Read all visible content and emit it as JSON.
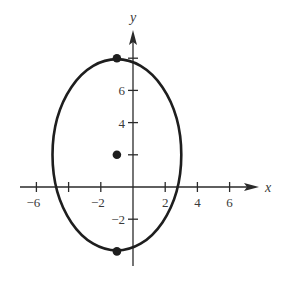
{
  "chart_data": {
    "type": "line",
    "title": "",
    "xlabel": "x",
    "ylabel": "y",
    "xlim": [
      -7,
      7.8
    ],
    "ylim": [
      -5,
      9.8
    ],
    "grid": false,
    "x_ticks": [
      -6,
      -4,
      -2,
      2,
      4,
      6
    ],
    "x_tick_labels": [
      "-6",
      "",
      "-2",
      "2",
      "4",
      "6"
    ],
    "y_ticks": [
      -2,
      2,
      4,
      6,
      8
    ],
    "y_tick_labels": [
      "-2",
      "",
      "4",
      "6",
      ""
    ],
    "ellipse": {
      "center": [
        -1,
        2
      ],
      "semi_axis_x": 4,
      "semi_axis_y": 6,
      "equation": "(x+1)^2/16 + (y-2)^2/36 = 1"
    },
    "points": [
      {
        "name": "center",
        "x": -1,
        "y": 2
      },
      {
        "name": "top-vertex",
        "x": -1,
        "y": 8
      },
      {
        "name": "bottom-vertex",
        "x": -1,
        "y": -4
      }
    ]
  },
  "colors": {
    "curve": "#1e1e1e",
    "axis": "#2a2a2a",
    "text": "#3a3a3a",
    "background": "#ffffff"
  }
}
